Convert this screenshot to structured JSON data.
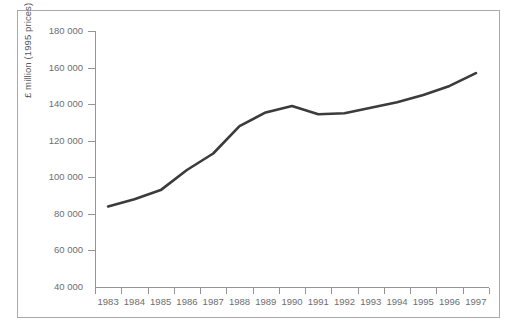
{
  "chart_data": {
    "type": "line",
    "title": "",
    "xlabel": "",
    "ylabel": "£ million (1995 prices)",
    "categories": [
      "1983",
      "1984",
      "1985",
      "1986",
      "1987",
      "1988",
      "1989",
      "1990",
      "1991",
      "1992",
      "1993",
      "1994",
      "1995",
      "1996",
      "1997"
    ],
    "x": [
      1983,
      1984,
      1985,
      1986,
      1987,
      1988,
      1989,
      1990,
      1991,
      1992,
      1993,
      1994,
      1995,
      1996,
      1997
    ],
    "values": [
      84000,
      88000,
      93000,
      104000,
      113000,
      128000,
      135500,
      139000,
      134500,
      135000,
      138000,
      141000,
      145000,
      150000,
      157000
    ],
    "series": [
      {
        "name": "£ million (1995 prices)",
        "values": [
          84000,
          88000,
          93000,
          104000,
          113000,
          128000,
          135500,
          139000,
          134500,
          135000,
          138000,
          141000,
          145000,
          150000,
          157000
        ]
      }
    ],
    "ylim": [
      40000,
      180000
    ],
    "ytick_values": [
      180000,
      160000,
      140000,
      120000,
      100000,
      80000,
      60000,
      40000
    ],
    "ytick_labels": [
      "180 000",
      "160 000",
      "140 000",
      "120 000",
      "100 000",
      "80 000",
      "60 000",
      "40 000"
    ],
    "grid": false,
    "legend": "none",
    "line_color": "#3b3b3d",
    "axis_color": "#939598",
    "text_color": "#6d6e71",
    "background": "#ffffff"
  }
}
